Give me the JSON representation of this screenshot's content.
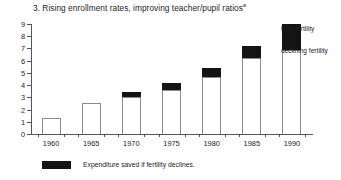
{
  "chart_data": {
    "type": "bar",
    "title": "3. Rising enrollment rates, improving teacher/pupil ratios",
    "title_superscript": "a",
    "xlabel": "",
    "ylabel": "",
    "ylim": [
      0,
      9
    ],
    "y_ticks": [
      0,
      1,
      2,
      3,
      4,
      5,
      6,
      7,
      8,
      9
    ],
    "grid": false,
    "stacked": true,
    "categories": [
      "1960",
      "1965",
      "1970",
      "1975",
      "1980",
      "1985",
      "1990"
    ],
    "series": [
      {
        "name": "declining fertility",
        "color": "#ffffff",
        "values": [
          1.3,
          2.5,
          3.0,
          3.6,
          4.7,
          6.2,
          6.9
        ]
      },
      {
        "name": "high fertility",
        "color": "#141414",
        "values": [
          0.0,
          0.0,
          0.4,
          0.6,
          0.7,
          1.0,
          2.1
        ]
      }
    ],
    "totals": [
      1.3,
      2.5,
      3.4,
      4.2,
      5.4,
      7.2,
      9.0
    ],
    "annotations": [
      {
        "name": "high-fertility",
        "text": "high fertility"
      },
      {
        "name": "declining-fertility",
        "text": "declining fertility"
      }
    ],
    "legend": {
      "position": "below",
      "swatch_color": "#141414",
      "text": "Expenditure saved if fertility declines."
    }
  }
}
